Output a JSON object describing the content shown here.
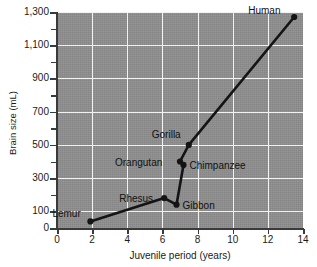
{
  "chart_data": {
    "type": "line",
    "title": "",
    "xlabel": "Juvenile period (years)",
    "ylabel": "Brain size (mL)",
    "xlim": [
      0,
      14
    ],
    "ylim": [
      0,
      1300
    ],
    "grid": true,
    "legend": "none",
    "x_ticks": [
      "0",
      "2",
      "4",
      "6",
      "8",
      "10",
      "12",
      "14"
    ],
    "x_tick_values": [
      0,
      2,
      4,
      6,
      8,
      10,
      12,
      14
    ],
    "y_ticks": [
      "0",
      "100",
      "300",
      "500",
      "700",
      "900",
      "1,100",
      "1,300"
    ],
    "y_tick_values": [
      0,
      100,
      300,
      500,
      700,
      900,
      1100,
      1300
    ],
    "y_minor_tick_values": [
      200,
      400,
      600,
      800,
      1000,
      1200
    ],
    "series": [
      {
        "name": "Primate brain size vs juvenile period",
        "points": [
          {
            "label": "Lemur",
            "x": 1.9,
            "y": 40,
            "label_dx": -38,
            "label_dy": -13
          },
          {
            "label": "Rhesus",
            "x": 6.1,
            "y": 180,
            "label_dx": -45,
            "label_dy": -5
          },
          {
            "label": "Gibbon",
            "x": 6.8,
            "y": 140,
            "label_dx": 6,
            "label_dy": -5
          },
          {
            "label": "Orangutan",
            "x": 7.0,
            "y": 400,
            "label_dx": -65,
            "label_dy": -5
          },
          {
            "label": "Chimpanzee",
            "x": 7.2,
            "y": 380,
            "label_dx": 6,
            "label_dy": -5
          },
          {
            "label": "Gorilla",
            "x": 7.5,
            "y": 500,
            "label_dx": -37,
            "label_dy": -16
          },
          {
            "label": "Human",
            "x": 13.5,
            "y": 1270,
            "label_dx": -46,
            "label_dy": -12
          }
        ]
      }
    ],
    "colors": {
      "plot_background": "#8e8e8e",
      "gridline": "#f2f2f2",
      "axis": "#3a3a3a",
      "line": "#141414",
      "marker": "#141414",
      "text": "#1a1a1a",
      "page_background": "#ffffff"
    }
  }
}
